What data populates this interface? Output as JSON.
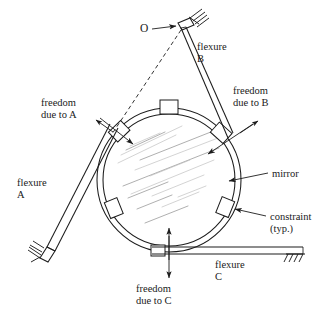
{
  "figure": {
    "type": "engineering-diagram",
    "width": 331,
    "height": 317,
    "background_color": "#ffffff",
    "line_color": "#1c1c1c",
    "streak_color": "#9a9a9a"
  },
  "labels": {
    "pivot_o": "O",
    "flexure_b": {
      "line1": "flexure",
      "line2": "B"
    },
    "flexure_a": {
      "line1": "flexure",
      "line2": "A"
    },
    "flexure_c": {
      "line1": "flexure",
      "line2": "C"
    },
    "freedom_a": {
      "line1": "freedom",
      "line2": "due to A"
    },
    "freedom_b": {
      "line1": "freedom",
      "line2": "due to B"
    },
    "freedom_c": {
      "line1": "freedom",
      "line2": "due to C"
    },
    "mirror": "mirror",
    "constraint": {
      "line1": "constraint",
      "line2": "(typ.)"
    }
  },
  "components": [
    {
      "name": "mirror",
      "kind": "circular-ring",
      "label": "mirror"
    },
    {
      "name": "flexure-a",
      "kind": "flexure-strut",
      "label": "flexure A"
    },
    {
      "name": "flexure-b",
      "kind": "flexure-strut",
      "label": "flexure B"
    },
    {
      "name": "flexure-c",
      "kind": "flexure-strut",
      "label": "flexure C"
    },
    {
      "name": "constraint-block",
      "kind": "constraint",
      "label": "constraint (typ.)"
    },
    {
      "name": "pivot-point",
      "kind": "instant-center",
      "label": "O"
    }
  ],
  "annotations": [
    {
      "name": "freedom-due-to-a",
      "text": "freedom due to A",
      "kind": "direction-arrow"
    },
    {
      "name": "freedom-due-to-b",
      "text": "freedom due to B",
      "kind": "direction-arrow"
    },
    {
      "name": "freedom-due-to-c",
      "text": "freedom due to C",
      "kind": "double-arrow"
    }
  ]
}
